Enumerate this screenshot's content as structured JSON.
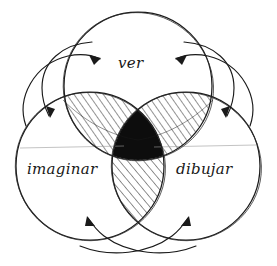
{
  "diagram": {
    "type": "venn-three-set",
    "title": "",
    "style": "hand-drawn sketch, black ink on white paper",
    "background_color": "#ffffff",
    "ink_color": "#1a1a1a",
    "core_fill_color": "#0d0d0d",
    "sets": [
      {
        "id": "ver",
        "label": "ver",
        "position": "top",
        "center_x": 138,
        "center_y": 86,
        "radius": 74
      },
      {
        "id": "imaginar",
        "label": "imaginar",
        "position": "bottom-left",
        "center_x": 90,
        "center_y": 166,
        "radius": 74
      },
      {
        "id": "dibujar",
        "label": "dibujar",
        "position": "bottom-right",
        "center_x": 186,
        "center_y": 166,
        "radius": 74
      }
    ],
    "regions": [
      {
        "id": "ver-imaginar",
        "members": [
          "ver",
          "imaginar"
        ],
        "fill": "diagonal-hatch",
        "hatch_direction": "lower-left to upper-right"
      },
      {
        "id": "ver-dibujar",
        "members": [
          "ver",
          "dibujar"
        ],
        "fill": "diagonal-hatch",
        "hatch_direction": "lower-left to upper-right"
      },
      {
        "id": "imaginar-dibujar",
        "members": [
          "imaginar",
          "dibujar"
        ],
        "fill": "diagonal-hatch",
        "hatch_direction": "lower-left to upper-right"
      },
      {
        "id": "center",
        "members": [
          "ver",
          "imaginar",
          "dibujar"
        ],
        "fill": "solid-black"
      }
    ],
    "arrows": [
      {
        "id": "arrow-to-ver-left",
        "direction": "points up-right into the ver circle",
        "from": "imaginar",
        "to": "ver"
      },
      {
        "id": "arrow-to-imaginar-top",
        "direction": "points down-left into the imaginar circle",
        "from": "ver",
        "to": "imaginar"
      },
      {
        "id": "arrow-to-ver-right",
        "direction": "points up-left into the ver circle",
        "from": "dibujar",
        "to": "ver"
      },
      {
        "id": "arrow-to-dibujar-top",
        "direction": "points down-right into the dibujar circle",
        "from": "ver",
        "to": "dibujar"
      },
      {
        "id": "arrow-to-imaginar-bottom",
        "direction": "points up-left into the imaginar circle",
        "from": "dibujar",
        "to": "imaginar"
      },
      {
        "id": "arrow-to-dibujar-bottom",
        "direction": "points up-right into the dibujar circle",
        "from": "imaginar",
        "to": "dibujar"
      }
    ]
  }
}
